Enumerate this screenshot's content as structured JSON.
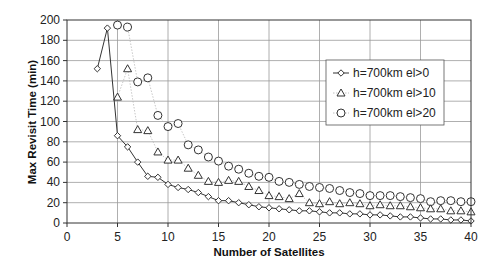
{
  "chart_data": {
    "type": "line",
    "title": "",
    "xlabel": "Number of Satellites",
    "ylabel": "Max Revisit Time (min)",
    "xlim": [
      0,
      40
    ],
    "ylim": [
      0,
      200
    ],
    "x_ticks": [
      0,
      5,
      10,
      15,
      20,
      25,
      30,
      35,
      40
    ],
    "y_ticks": [
      0,
      20,
      40,
      60,
      80,
      100,
      120,
      140,
      160,
      180,
      200
    ],
    "grid": true,
    "legend_position": "upper right (inside plot)",
    "series": [
      {
        "name": "h=700km el>0",
        "marker": "diamond",
        "line": "solid",
        "x": [
          3,
          4,
          5,
          6,
          7,
          8,
          9,
          10,
          11,
          12,
          13,
          14,
          15,
          16,
          17,
          18,
          19,
          20,
          21,
          22,
          23,
          24,
          25,
          26,
          27,
          28,
          29,
          30,
          31,
          32,
          33,
          34,
          35,
          36,
          37,
          38,
          39,
          40
        ],
        "values": [
          152,
          192,
          86,
          75,
          60,
          46,
          45,
          38,
          35,
          33,
          30,
          26,
          22,
          22,
          20,
          18,
          16,
          15,
          14,
          13,
          12,
          12,
          11,
          10,
          10,
          9,
          9,
          8,
          8,
          7,
          6,
          6,
          5,
          4,
          4,
          3,
          3,
          2
        ]
      },
      {
        "name": "h=700km el>10",
        "marker": "triangle",
        "line": "dotted",
        "x": [
          5,
          6,
          7,
          8,
          9,
          10,
          11,
          12,
          13,
          14,
          15,
          16,
          17,
          18,
          19,
          20,
          21,
          22,
          23,
          24,
          25,
          26,
          27,
          28,
          29,
          30,
          31,
          32,
          33,
          34,
          35,
          36,
          37,
          38,
          39,
          40
        ],
        "values": [
          124,
          152,
          92,
          91,
          70,
          62,
          62,
          54,
          47,
          41,
          40,
          42,
          41,
          36,
          32,
          27,
          26,
          24,
          29,
          20,
          19,
          21,
          19,
          20,
          19,
          17,
          18,
          17,
          17,
          16,
          15,
          14,
          14,
          12,
          12,
          11
        ]
      },
      {
        "name": "h=700km el>20",
        "marker": "circle",
        "line": "dotted",
        "x": [
          5,
          6,
          7,
          8,
          9,
          10,
          11,
          12,
          13,
          14,
          15,
          16,
          17,
          18,
          19,
          20,
          21,
          22,
          23,
          24,
          25,
          26,
          27,
          28,
          29,
          30,
          31,
          32,
          33,
          34,
          35,
          36,
          37,
          38,
          39,
          40
        ],
        "values": [
          195,
          193,
          139,
          143,
          106,
          95,
          98,
          77,
          72,
          65,
          61,
          56,
          53,
          49,
          46,
          45,
          41,
          40,
          38,
          36,
          35,
          34,
          32,
          30,
          29,
          27,
          27,
          27,
          26,
          25,
          24,
          21,
          22,
          22,
          21,
          21
        ]
      }
    ]
  },
  "legend": {
    "items": [
      {
        "label": "h=700km el>0",
        "marker": "diamond"
      },
      {
        "label": "h=700km el>10",
        "marker": "triangle"
      },
      {
        "label": "h=700km el>20",
        "marker": "circle"
      }
    ]
  },
  "axes": {
    "x_title": "Number of Satellites",
    "y_title": "Max Revisit Time (min)"
  },
  "colors": {
    "plot_border": "#333333",
    "grid": "#9a9a9a",
    "series_line": "#333333",
    "dotted_line": "#b0b0b0",
    "marker_stroke": "#333333",
    "background": "#ffffff"
  }
}
